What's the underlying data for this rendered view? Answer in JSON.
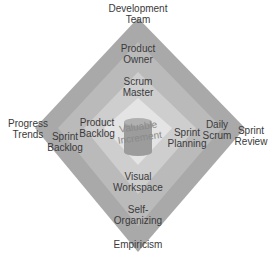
{
  "diagram": {
    "type": "nested-diamond",
    "layers": [
      {
        "name": "outer",
        "color": "#a9a9a9"
      },
      {
        "name": "second",
        "color": "#bababa"
      },
      {
        "name": "third",
        "color": "#cecece"
      },
      {
        "name": "inner",
        "color": "#e4e4e4"
      }
    ],
    "center_shape": {
      "type": "cylinder",
      "color": "#9c9c9c"
    },
    "labels": {
      "top_outer": "Development\nTeam",
      "top_2": "Product\nOwner",
      "top_3": "Scrum\nMaster",
      "left_outer": "Progress\nTrends",
      "left_2": "Sprint\nBacklog",
      "left_3": "Product\nBacklog",
      "center": "Valuable\nIncrement",
      "right_3": "Sprint\nPlanning",
      "right_2": "Daily\nScrum",
      "right_outer": "Sprint\nReview",
      "bottom_3": "Visual\nWorkspace",
      "bottom_2": "Self-\nOrganizing",
      "bottom_outer": "Empiricism"
    }
  }
}
